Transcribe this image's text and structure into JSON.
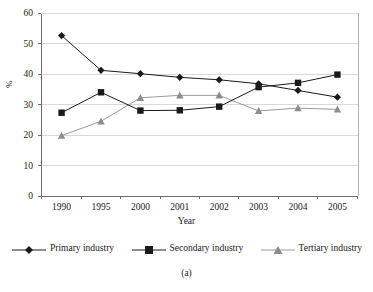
{
  "chart_data": {
    "type": "line",
    "title": "",
    "subtitle": "",
    "caption": "(a)",
    "xlabel": "Year",
    "ylabel": "%",
    "categories": [
      "1990",
      "1995",
      "2000",
      "2001",
      "2002",
      "2003",
      "2004",
      "2005"
    ],
    "ylim": [
      0,
      60
    ],
    "yticks": [
      0,
      10,
      20,
      30,
      40,
      50,
      60
    ],
    "ytick_labels": [
      "0",
      "10",
      "20",
      "30",
      "40",
      "50",
      "60"
    ],
    "grid": "horizontal",
    "legend_position": "below-axes",
    "series": [
      {
        "name": "Primary industry",
        "marker": "diamond",
        "color": "#1a1a1a",
        "values": [
          52.6,
          41.2,
          40.1,
          38.9,
          38.1,
          36.8,
          34.6,
          32.4
        ]
      },
      {
        "name": "Secondary industry",
        "marker": "square",
        "color": "#1a1a1a",
        "values": [
          27.3,
          34.0,
          28.0,
          28.1,
          29.3,
          35.7,
          37.1,
          39.8
        ]
      },
      {
        "name": "Tertiary industry",
        "marker": "triangle",
        "color": "#8c8c8c",
        "values": [
          19.8,
          24.5,
          32.2,
          33.0,
          33.0,
          27.9,
          28.8,
          28.4
        ]
      }
    ]
  },
  "legend": {
    "items": [
      {
        "label": "Primary industry"
      },
      {
        "label": "Secondary industry"
      },
      {
        "label": "Tertiary industry"
      }
    ]
  },
  "axes": {
    "x_label": "Year",
    "y_label": "%"
  },
  "figure": {
    "caption": "(a)"
  },
  "colors": {
    "dark": "#1a1a1a",
    "gray": "#8c8c8c",
    "grid": "#d9d9d9",
    "frame": "#b0b0b0",
    "background": "#ffffff"
  }
}
